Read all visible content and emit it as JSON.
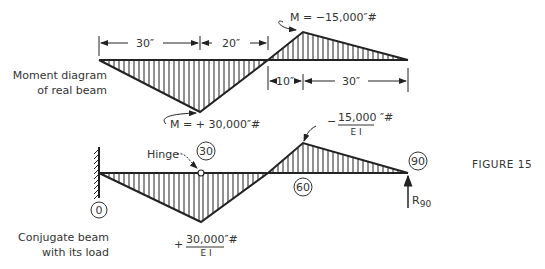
{
  "figure": {
    "label": "FIGURE 15"
  },
  "top_diagram": {
    "caption_line1": "Moment diagram",
    "caption_line2": "of real beam",
    "dim_top": [
      "30″",
      "20″"
    ],
    "dim_bottom": [
      "10″",
      "30″"
    ],
    "max_positive_label": "M = + 30,000″#",
    "max_negative_label": "M = −15,000″#",
    "points": {
      "left": [
        99,
        60
      ],
      "trough": [
        200,
        112
      ],
      "zero": [
        268,
        60
      ],
      "peak": [
        303,
        32
      ],
      "right": [
        408,
        60
      ]
    }
  },
  "bottom_diagram": {
    "caption_line1": "Conjugate beam",
    "caption_line2": "with its load",
    "hinge_label": "Hinge",
    "stations": [
      "0",
      "30",
      "60",
      "90"
    ],
    "load_positive_sign": "+",
    "load_positive_numerator": "30,000″#",
    "load_negative_sign": "−",
    "load_negative_numerator": "15,000 ″#",
    "load_denominator": "E I",
    "reaction_label": "R",
    "reaction_subscript": "90",
    "points": {
      "left": [
        99,
        173
      ],
      "trough": [
        201,
        222
      ],
      "zero": [
        268,
        173
      ],
      "peak": [
        303,
        143
      ],
      "right": [
        408,
        173
      ]
    }
  }
}
